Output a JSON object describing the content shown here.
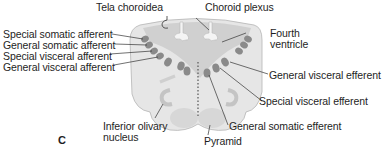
{
  "figure": {
    "panel_label": "C",
    "colors": {
      "tissue": "#e4e4e4",
      "ventricle": "#cfcfcf",
      "nucleus": "#8a8a8a",
      "leader_line": "#333333",
      "text": "#1e1e1e"
    },
    "labels": {
      "tela_choroidea": "Tela choroidea",
      "choroid_plexus": "Choroid plexus",
      "fourth_ventricle_line1": "Fourth",
      "fourth_ventricle_line2": "ventricle",
      "special_somatic_afferent": "Special somatic afferent",
      "general_somatic_afferent": "General somatic afferent",
      "special_visceral_afferent": "Special visceral afferent",
      "general_visceral_afferent": "General visceral afferent",
      "general_visceral_efferent": "General visceral efferent",
      "special_visceral_efferent": "Special visceral efferent",
      "general_somatic_efferent": "General somatic efferent",
      "inferior_olivary_line1": "Inferior olivary",
      "inferior_olivary_line2": "nucleus",
      "pyramid": "Pyramid"
    }
  }
}
